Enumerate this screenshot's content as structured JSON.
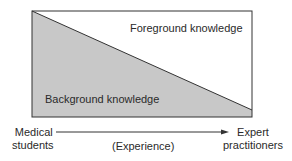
{
  "diagram": {
    "foreground_label": "Foreground knowledge",
    "background_label": "Background knowledge",
    "axis": {
      "left_label_line1": "Medical",
      "left_label_line2": "students",
      "middle_label": "(Experience)",
      "right_label_line1": "Expert",
      "right_label_line2": "practitioners"
    },
    "colors": {
      "background_fill": "#c8c8c8",
      "foreground_fill": "#ffffff",
      "line": "#333333"
    }
  }
}
